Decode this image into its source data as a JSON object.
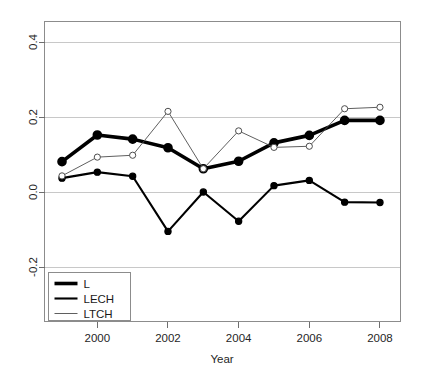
{
  "chart_data": {
    "type": "line",
    "title": "",
    "xlabel": "Year",
    "ylabel": "",
    "x": [
      1999,
      2000,
      2001,
      2002,
      2003,
      2004,
      2005,
      2006,
      2007,
      2008
    ],
    "xlim": [
      1998.5,
      2008.5
    ],
    "ylim": [
      -0.28,
      0.45
    ],
    "xticks": [
      2000,
      2002,
      2004,
      2006,
      2008
    ],
    "xticklabels": [
      "2000",
      "2002",
      "2004",
      "2006",
      "2008"
    ],
    "yticks": [
      -0.2,
      0.0,
      0.2,
      0.4
    ],
    "yticklabels": [
      "-0.2",
      "0.0",
      "0.2",
      "0.4"
    ],
    "grid": true,
    "grid_axis": "y",
    "legend_position": "bottom-left",
    "series": [
      {
        "name": "L",
        "values": [
          0.081,
          0.152,
          0.141,
          0.118,
          0.062,
          0.082,
          0.131,
          0.151,
          0.191,
          0.191
        ],
        "line_width": 3.6,
        "marker": "filled-circle",
        "color": "#000000"
      },
      {
        "name": "LECH",
        "values": [
          0.037,
          0.053,
          0.042,
          -0.105,
          0.0,
          -0.078,
          0.017,
          0.031,
          -0.027,
          -0.028
        ],
        "line_width": 2.1,
        "marker": "filled-circle",
        "color": "#000000"
      },
      {
        "name": "LTCH",
        "values": [
          0.043,
          0.093,
          0.098,
          0.215,
          0.062,
          0.163,
          0.119,
          0.122,
          0.222,
          0.226
        ],
        "line_width": 0.9,
        "marker": "open-circle",
        "color": "#4d4d4d"
      }
    ]
  },
  "legend": {
    "entries": [
      {
        "label": "L"
      },
      {
        "label": "LECH"
      },
      {
        "label": "LTCH"
      }
    ]
  },
  "axes": {
    "x_title": "Year",
    "y_title": ""
  }
}
